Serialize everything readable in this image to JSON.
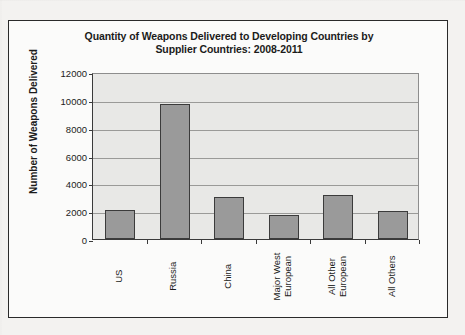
{
  "chart_data": {
    "type": "bar",
    "title": "Quantity of Weapons Delivered to Developing Countries by Supplier Countries: 2008-2011",
    "title_lines": [
      "Quantity of Weapons Delivered to Developing Countries by",
      "Supplier Countries: 2008-2011"
    ],
    "categories": [
      "US",
      "Russia",
      "China",
      "Major West European",
      "All Other European",
      "All Others"
    ],
    "category_label_lines": [
      [
        "US"
      ],
      [
        "Russia"
      ],
      [
        "China"
      ],
      [
        "Major West",
        "European"
      ],
      [
        "All Other",
        "European"
      ],
      [
        "All Others"
      ]
    ],
    "values": [
      2100,
      9700,
      3000,
      1700,
      3150,
      2000
    ],
    "xlabel": "",
    "ylabel": "Number of Weapons Delivered",
    "ylim": [
      0,
      12000
    ],
    "ytick_step": 2000,
    "yticks": [
      0,
      2000,
      4000,
      6000,
      8000,
      10000,
      12000
    ],
    "ytick_labels": [
      "0",
      "2000",
      "4000",
      "6000",
      "8000",
      "10000",
      "12000"
    ],
    "grid": "horizontal",
    "legend": "none",
    "bar_color": "#9a9a9a",
    "bar_border_color": "#3b3b3b",
    "plot_background": "#e8e8e6",
    "axis_color": "#3a3a3a",
    "gridline_color": "#9a9a98"
  }
}
